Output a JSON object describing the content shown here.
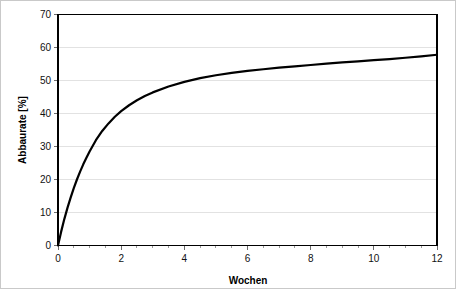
{
  "chart_data": {
    "type": "line",
    "title": "",
    "subtitle": "",
    "xlabel": "Wochen",
    "ylabel": "Abbaurate [%]",
    "xlim": [
      0,
      12
    ],
    "ylim": [
      0,
      70
    ],
    "xticks": [
      0,
      2,
      4,
      6,
      8,
      10,
      12
    ],
    "xtick_labels": [
      "0",
      "2",
      "4",
      "6",
      "8",
      "10",
      "12"
    ],
    "yticks": [
      0,
      10,
      20,
      30,
      40,
      50,
      60,
      70
    ],
    "ytick_labels": [
      "0",
      "10",
      "20",
      "30",
      "40",
      "50",
      "60",
      "70"
    ],
    "grid": "horizontal",
    "grid_color": "#e2e2e2",
    "legend": "none",
    "curve_color": "#000000",
    "series": [
      {
        "name": "Abbaurate",
        "x": [
          0,
          0.1,
          0.2,
          0.3,
          0.4,
          0.5,
          0.6,
          0.7,
          0.8,
          0.9,
          1.0,
          1.2,
          1.4,
          1.6,
          1.8,
          2.0,
          2.25,
          2.5,
          2.75,
          3.0,
          3.5,
          4.0,
          4.5,
          5.0,
          5.5,
          6.0,
          6.5,
          7.0,
          7.5,
          8.0,
          8.5,
          9.0,
          9.5,
          10.0,
          10.5,
          11.0,
          11.5,
          12.0
        ],
        "values": [
          0,
          4.2,
          8.0,
          11.4,
          14.5,
          17.4,
          20.0,
          22.4,
          24.6,
          26.6,
          28.5,
          31.9,
          34.7,
          37.0,
          39.0,
          40.7,
          42.5,
          44.0,
          45.3,
          46.4,
          48.2,
          49.6,
          50.7,
          51.6,
          52.3,
          52.9,
          53.4,
          53.9,
          54.3,
          54.7,
          55.1,
          55.5,
          55.8,
          56.2,
          56.5,
          56.9,
          57.3,
          57.8
        ]
      }
    ],
    "annotations": []
  },
  "axes": {
    "x_axis_title": "Wochen",
    "y_axis_title": "Abbaurate [%]"
  }
}
